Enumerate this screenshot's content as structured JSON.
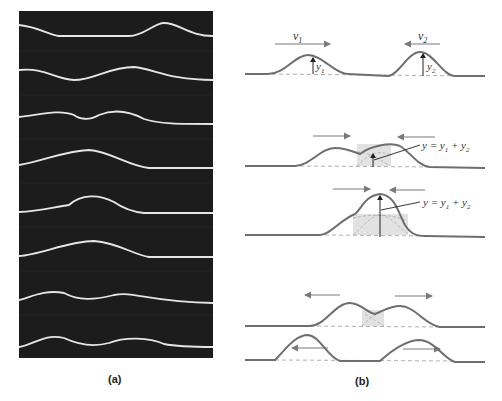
{
  "figure": {
    "panel_a": {
      "caption": "(a)",
      "description": "Sequence of photographs of two pulses on a string passing through each other",
      "frame_count": 8
    },
    "panel_b": {
      "caption": "(b)",
      "rows": [
        {
          "labels": {
            "v1": "v",
            "v1_sub": "1",
            "v2": "v",
            "v2_sub": "2",
            "y1": "y",
            "y1_sub": "1",
            "y2": "y",
            "y2_sub": "2"
          }
        },
        {
          "equation": "y = y₁ + y₂"
        },
        {
          "equation": "y = y₁ + y₂"
        },
        {},
        {}
      ]
    },
    "colors": {
      "photo_bg": "#1c1c1c",
      "string_highlight": "#e6e6e6",
      "pulse_line": "#6e6e6e",
      "dashed_line": "#9a9a9a",
      "overlap_shade": "#e2e2e2",
      "arrow": "#7a7a7a"
    }
  }
}
